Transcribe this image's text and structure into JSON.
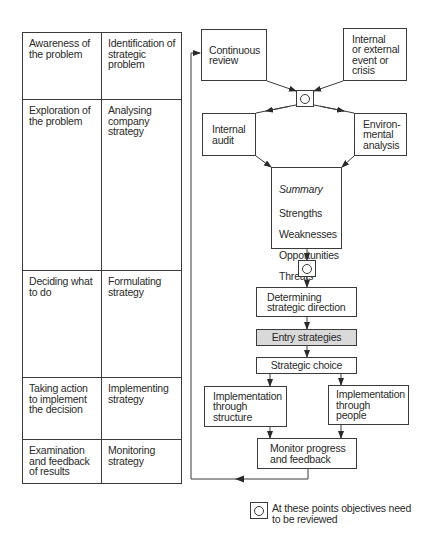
{
  "table": {
    "rows": [
      {
        "stage": "Awareness of\nthe problem",
        "activity": "Identification of\nstrategic\nproblem"
      },
      {
        "stage": "Exploration of\nthe problem",
        "activity": "Analysing\ncompany\nstrategy"
      },
      {
        "stage": "Deciding what\nto do",
        "activity": "Formulating\nstrategy"
      },
      {
        "stage": "Taking action\nto implement\nthe decision",
        "activity": "Implementing\nstrategy"
      },
      {
        "stage": "Examination\nand feedback\nof results",
        "activity": "Monitoring\nstrategy"
      }
    ]
  },
  "flow": {
    "continuous_review": "Continuous\nreview",
    "internal_external_event": "Internal\nor external\nevent or\ncrisis",
    "internal_audit": "Internal\naudit",
    "environmental_analysis": "Environ-\nmental\nanalysis",
    "summary": {
      "title": "Summary",
      "items": [
        "Strengths",
        "Weaknesses",
        "Opportunities",
        "Threats"
      ],
      "extra": "Core skills"
    },
    "determining_direction": "Determining\nstrategic direction",
    "entry_strategies": "Entry strategies",
    "strategic_choice": "Strategic choice",
    "implementation_structure": "Implementation\nthrough\nstructure",
    "implementation_people": "Implementation\nthrough\npeople",
    "monitor_progress": "Monitor progress\nand feedback"
  },
  "legend": {
    "text": "At these points objectives need\nto be reviewed"
  },
  "colors": {
    "line": "#3a3a3a",
    "highlight_fill": "#d9d9d9",
    "background": "#ffffff"
  }
}
